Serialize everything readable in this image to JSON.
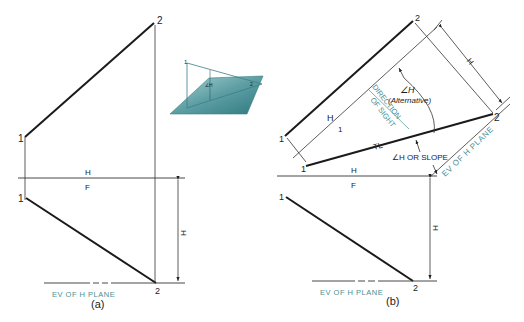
{
  "figure": {
    "panels": [
      {
        "id": "a",
        "caption": "(a)",
        "points": {
          "top_1": "1",
          "top_2": "2",
          "front_1": "1",
          "front_2": "2"
        },
        "fold_line": {
          "upper": "H",
          "lower": "F"
        },
        "dimension": "H",
        "ev_label": "EV OF H PLANE"
      },
      {
        "id": "b",
        "caption": "(b)",
        "points": {
          "top_1": "1",
          "top_2": "2",
          "front_1": "1",
          "front_2": "2",
          "aux_1": "1",
          "aux_2": "2"
        },
        "fold_line": {
          "upper": "H",
          "lower": "F"
        },
        "aux_fold_line": {
          "upper": "H",
          "lower": "1"
        },
        "dimension_front": "H",
        "dimension_aux": "H",
        "ev_label_front": "EV OF H PLANE",
        "ev_label_aux": "EV OF H PLANE",
        "direction_of_sight": [
          "DIRECTION",
          "OF SIGHT"
        ],
        "angle_alt_label": [
          "∠H",
          "(Alternative)"
        ],
        "true_length_label": "TL",
        "angle_slope_label": "∠H OR SLOPE"
      }
    ],
    "inset": {
      "point_1": "1",
      "point_2": "2",
      "angle_label": "∠H"
    },
    "colors": {
      "line": "#1a1a1a",
      "thin_line": "#333333",
      "teal_text": "#4a8f94",
      "plane_fill_light": "#9cc9cc",
      "plane_fill_dark": "#3f8c92"
    }
  }
}
